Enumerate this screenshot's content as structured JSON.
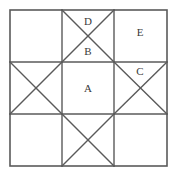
{
  "figure": {
    "type": "geometric-diagram",
    "background_color": "#ffffff",
    "line_color": "#5a5a5a",
    "label_color": "#3a3a3a",
    "outer_square": {
      "x": 10,
      "y": 10,
      "width": 157,
      "height": 156,
      "stroke_width": 1.6
    },
    "grid": {
      "rows": 3,
      "columns": 3,
      "x_lines": [
        10,
        62,
        114,
        167
      ],
      "y_lines": [
        10,
        62,
        114,
        166
      ],
      "stroke_width": 1.4
    },
    "cells_with_x_diagonals": [
      "top-middle",
      "middle-left",
      "middle-right",
      "bottom-middle"
    ],
    "empty_cells": [
      "top-left",
      "top-right",
      "center",
      "bottom-left",
      "bottom-right"
    ],
    "diagonal_stroke_width": 1.4,
    "labels": [
      {
        "text": "D",
        "x": 88,
        "y": 22,
        "region": "top-middle-upper-triangle"
      },
      {
        "text": "B",
        "x": 88,
        "y": 52,
        "region": "top-middle-lower-triangle"
      },
      {
        "text": "E",
        "x": 140,
        "y": 33,
        "region": "top-right-cell"
      },
      {
        "text": "A",
        "x": 88,
        "y": 89,
        "region": "center-cell"
      },
      {
        "text": "C",
        "x": 140,
        "y": 72,
        "region": "middle-right-upper-triangle"
      }
    ]
  }
}
